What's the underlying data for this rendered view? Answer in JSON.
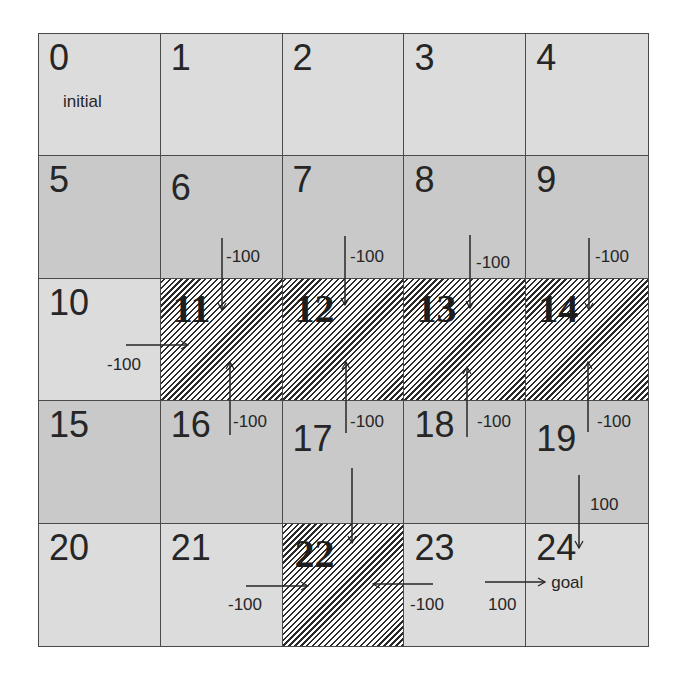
{
  "diagram": {
    "type": "gridworld",
    "rows": 5,
    "cols": 5,
    "colors": {
      "light_cell": "#dcdcdc",
      "dark_cell": "#c9c9c9",
      "hatched_line": "#2a2a2a",
      "border": "#4a4a4a",
      "text": "#262626"
    },
    "cells": [
      {
        "id": "0",
        "label": "initial",
        "style": "light"
      },
      {
        "id": "1",
        "label": "",
        "style": "light"
      },
      {
        "id": "2",
        "label": "",
        "style": "light"
      },
      {
        "id": "3",
        "label": "",
        "style": "light"
      },
      {
        "id": "4",
        "label": "",
        "style": "light"
      },
      {
        "id": "5",
        "label": "",
        "style": "dark"
      },
      {
        "id": "6",
        "label": "",
        "style": "dark"
      },
      {
        "id": "7",
        "label": "",
        "style": "dark"
      },
      {
        "id": "8",
        "label": "",
        "style": "dark"
      },
      {
        "id": "9",
        "label": "",
        "style": "dark"
      },
      {
        "id": "10",
        "label": "",
        "style": "light"
      },
      {
        "id": "11",
        "label": "",
        "style": "hatched"
      },
      {
        "id": "12",
        "label": "",
        "style": "hatched"
      },
      {
        "id": "13",
        "label": "",
        "style": "hatched"
      },
      {
        "id": "14",
        "label": "",
        "style": "hatched"
      },
      {
        "id": "15",
        "label": "",
        "style": "dark"
      },
      {
        "id": "16",
        "label": "",
        "style": "dark"
      },
      {
        "id": "17",
        "label": "",
        "style": "dark"
      },
      {
        "id": "18",
        "label": "",
        "style": "dark"
      },
      {
        "id": "19",
        "label": "",
        "style": "dark"
      },
      {
        "id": "20",
        "label": "",
        "style": "light"
      },
      {
        "id": "21",
        "label": "",
        "style": "light"
      },
      {
        "id": "22",
        "label": "",
        "style": "hatched"
      },
      {
        "id": "23",
        "label": "",
        "style": "light"
      },
      {
        "id": "24",
        "label": "goal",
        "style": "light"
      }
    ],
    "transitions": [
      {
        "from": "6",
        "to": "11",
        "reward": "-100"
      },
      {
        "from": "7",
        "to": "12",
        "reward": "-100"
      },
      {
        "from": "8",
        "to": "13",
        "reward": "-100"
      },
      {
        "from": "9",
        "to": "14",
        "reward": "-100"
      },
      {
        "from": "10",
        "to": "11",
        "reward": "-100"
      },
      {
        "from": "16",
        "to": "11",
        "reward": "-100"
      },
      {
        "from": "17",
        "to": "12",
        "reward": "-100"
      },
      {
        "from": "18",
        "to": "13",
        "reward": "-100"
      },
      {
        "from": "19",
        "to": "14",
        "reward": "-100"
      },
      {
        "from": "17",
        "to": "22",
        "reward": ""
      },
      {
        "from": "21",
        "to": "22",
        "reward": "-100"
      },
      {
        "from": "23",
        "to": "22",
        "reward": "-100"
      },
      {
        "from": "19",
        "to": "24",
        "reward": "100"
      },
      {
        "from": "23",
        "to": "24",
        "reward": "100"
      }
    ]
  }
}
